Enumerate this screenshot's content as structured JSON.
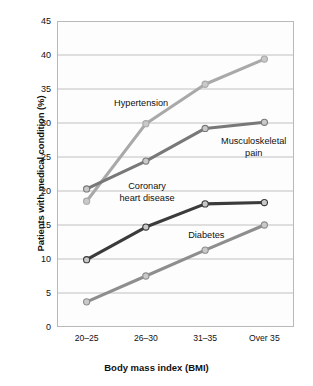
{
  "chart_data": {
    "type": "line",
    "title": "",
    "xlabel": "Body mass index (BMI)",
    "ylabel": "Patients with medical condition (%)",
    "categories": [
      "20–25",
      "26–30",
      "31–35",
      "Over 35"
    ],
    "ylim": [
      0,
      45
    ],
    "yticks": [
      0,
      5,
      10,
      15,
      20,
      25,
      30,
      35,
      40,
      45
    ],
    "grid": true,
    "legend_position": "inline-annotations",
    "series": [
      {
        "name": "Hypertension",
        "values": [
          18.5,
          29.9,
          35.7,
          39.4
        ],
        "color": "#a9a9a9"
      },
      {
        "name": "Musculoskeletal pain",
        "values": [
          20.3,
          24.4,
          29.2,
          30.1
        ],
        "color": "#787878"
      },
      {
        "name": "Coronary heart disease",
        "values": [
          9.9,
          14.7,
          18.1,
          18.3
        ],
        "color": "#3b3b3b"
      },
      {
        "name": "Diabetes",
        "values": [
          3.7,
          7.5,
          11.3,
          15.0
        ],
        "color": "#8e8e8e"
      }
    ],
    "annotations": [
      {
        "text": "Hypertension",
        "x": 1.42,
        "y": 32.7
      },
      {
        "text": "Musculoskeletal\npain",
        "x": 3.32,
        "y": 27.0
      },
      {
        "text": "Coronary\nheart disease",
        "x": 1.52,
        "y": 20.4
      },
      {
        "text": "Diabetes",
        "x": 2.52,
        "y": 13.2
      }
    ]
  },
  "axis": {
    "y_tick_labels": [
      "0",
      "5",
      "10",
      "15",
      "20",
      "25",
      "30",
      "35",
      "40",
      "45"
    ],
    "x_tick_labels": [
      "20–25",
      "26–30",
      "31–35",
      "Over 35"
    ],
    "y_title": "Patients with medical condition (%)",
    "x_title": "Body mass index (BMI)"
  },
  "style": {
    "grid_color": "#b9b9b9",
    "plot_border_color": "#b9b9b9",
    "plot_background": "#fdfdfd",
    "page_background": "#ffffff",
    "text_color": "#111111",
    "marker_fill": "#c9c9c9",
    "marker_stroke": "#6b6b6b"
  }
}
